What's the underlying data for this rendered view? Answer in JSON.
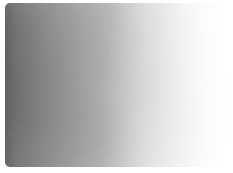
{
  "image": {
    "kind": "gradient-swatch",
    "title": "Grayscale Gradient Swatch",
    "width_px": 233,
    "height_px": 173,
    "background_color": "#ffffff",
    "shape": "rounded-rectangle",
    "corner_radius_px": 5,
    "texture": "mottled scanned-paper grain",
    "caption": "",
    "label": ""
  },
  "gradient": {
    "direction": "left-to-right",
    "start_color": "#6f6f6f",
    "mid_color": "#c3c3c3",
    "end_color": "#ffffff",
    "stops": [
      {
        "position_pct": 0,
        "color": "#6f6f6f"
      },
      {
        "position_pct": 14,
        "color": "#8c8c8c"
      },
      {
        "position_pct": 22,
        "color": "#9a9a9a"
      },
      {
        "position_pct": 31,
        "color": "#a8a8a8"
      },
      {
        "position_pct": 40,
        "color": "#b6b6b6"
      },
      {
        "position_pct": 48,
        "color": "#c3c3c3"
      },
      {
        "position_pct": 56,
        "color": "#cfcfcf"
      },
      {
        "position_pct": 64,
        "color": "#dadada"
      },
      {
        "position_pct": 72,
        "color": "#e3e3e3"
      },
      {
        "position_pct": 80,
        "color": "#ebebeb"
      },
      {
        "position_pct": 93,
        "color": "#f8f8f8"
      },
      {
        "position_pct": 100,
        "color": "#ffffff"
      }
    ]
  },
  "margins": {
    "top_px": 3,
    "left_px": 5,
    "right_px": 0,
    "bottom_px": 6
  }
}
